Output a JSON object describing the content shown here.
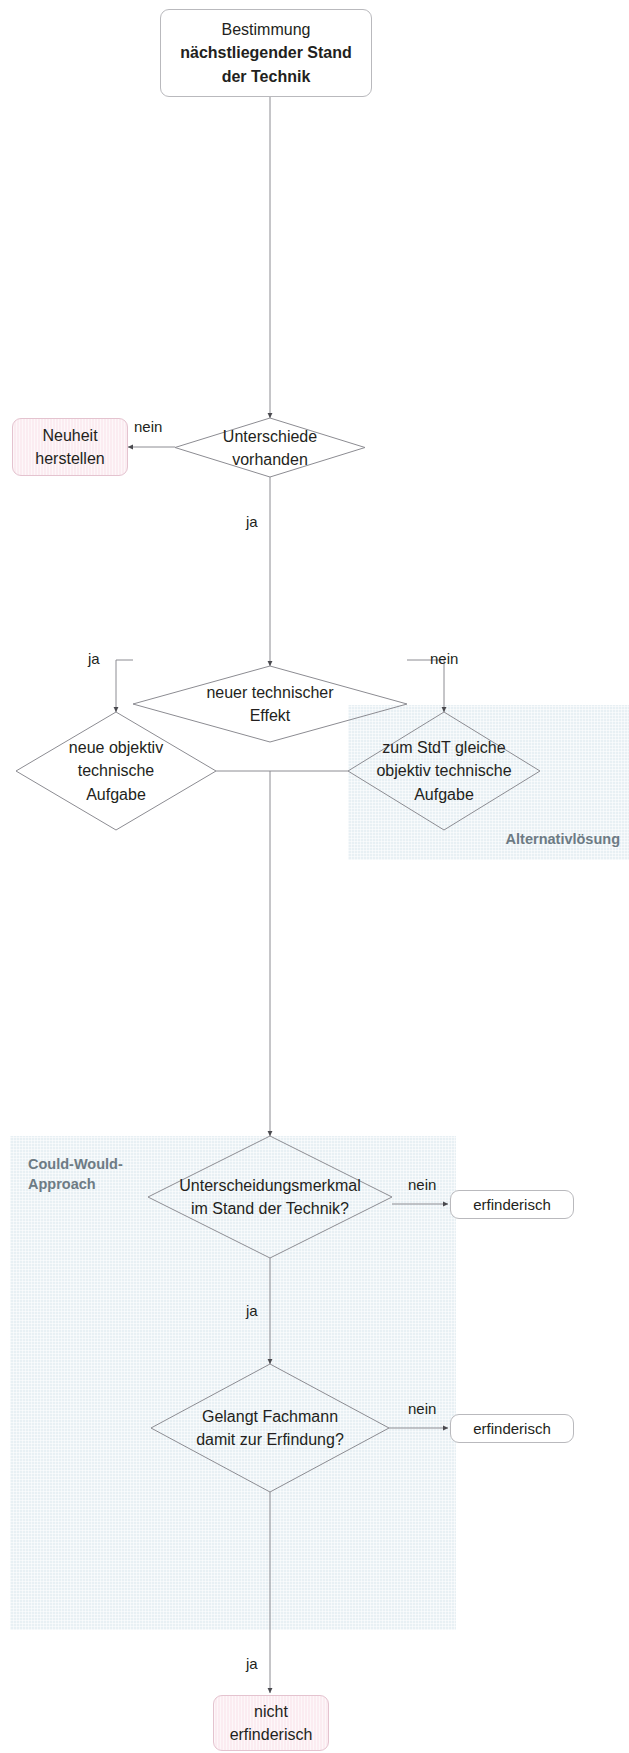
{
  "diagram": {
    "title_node": {
      "line1": "Bestimmung",
      "line2": "nächstliegender Stand",
      "line3": "der Technik"
    },
    "zones": [
      {
        "id": "alternativloesung",
        "label": "Alternativlösung",
        "color": "#e8f0f4"
      },
      {
        "id": "could-would",
        "label": "Could-Would-\nApproach",
        "color": "#e8f0f4"
      }
    ],
    "nodes": {
      "neuheit_herstellen": "Neuheit\nherstellen",
      "unterschiede_vorhanden": "Unterschiede\nvorhanden",
      "neuer_technischer_effekt": "neuer technischer\nEffekt",
      "neue_objektiv_technische_aufgabe": "neue objektiv\ntechnische\nAufgabe",
      "zum_stdt_gleiche_aufgabe": "zum StdT gleiche\nobjektiv technische\nAufgabe",
      "unterscheidungsmerkmal": "Unterscheidungsmerkmal\nim Stand der Technik?",
      "gelangt_fachmann": "Gelangt Fachmann\ndamit zur Erfindung?",
      "erfinderisch_1": "erfinderisch",
      "erfinderisch_2": "erfinderisch",
      "nicht_erfinderisch": "nicht\nerfinderisch"
    },
    "edge_labels": {
      "unterschiede_nein": "nein",
      "unterschiede_ja": "ja",
      "effekt_ja": "ja",
      "effekt_nein": "nein",
      "merkmal_nein": "nein",
      "merkmal_ja": "ja",
      "fachmann_nein": "nein",
      "fachmann_ja": "ja"
    },
    "colors": {
      "zone_tint": "#e8f0f4",
      "zone_label": "#6d7b84",
      "pink_fill": "#fbecf1",
      "pink_border": "#e4c3cf",
      "line": "#8c8c92",
      "box_border": "#b9b9bd",
      "text": "#231f20"
    }
  }
}
